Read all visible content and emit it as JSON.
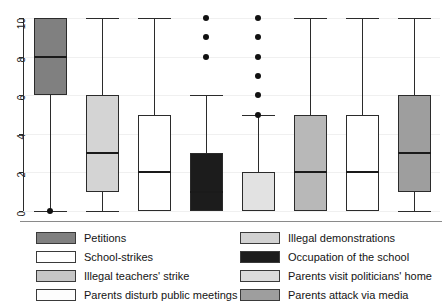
{
  "chart_data": {
    "type": "box",
    "title": "",
    "xlabel": "",
    "ylabel": "",
    "ylim": [
      0,
      10
    ],
    "yticks": [
      0,
      2,
      4,
      6,
      8,
      10
    ],
    "ytick_labels": [
      "0",
      "2",
      "4",
      "6",
      "8",
      "10"
    ],
    "grid": true,
    "legend_position": "bottom",
    "categories": [
      "Petitions",
      "School-strikes",
      "Illegal teachers' strike",
      "Parents disturb public meetings",
      "Illegal demonstrations",
      "Occupation of the school",
      "Parents visit politicians' home",
      "Parents attack via media",
      "Parents attack via media"
    ],
    "boxes": [
      {
        "name": "Petitions",
        "fill": "#808080",
        "whisker_low": 0,
        "q1": 6,
        "median": 8,
        "q3": 10,
        "whisker_high": 10,
        "outliers": [
          0
        ]
      },
      {
        "name": "School-strikes",
        "fill": "#d4d4d4",
        "whisker_low": 0,
        "q1": 1,
        "median": 3,
        "q3": 6,
        "whisker_high": 10,
        "outliers": []
      },
      {
        "name": "Illegal teachers' strike",
        "fill": "#ffffff",
        "whisker_low": 0,
        "q1": 0,
        "median": 2,
        "q3": 5,
        "whisker_high": 10,
        "outliers": []
      },
      {
        "name": "Parents disturb public meetings",
        "fill": "#1c1c1c",
        "whisker_low": 0,
        "q1": 0,
        "median": 1,
        "q3": 3,
        "whisker_high": 6,
        "outliers": [
          8,
          9,
          10
        ]
      },
      {
        "name": "Illegal demonstrations",
        "fill": "#e2e2e2",
        "whisker_low": 0,
        "q1": 0,
        "median": 0,
        "q3": 2,
        "whisker_high": 5,
        "outliers": [
          5,
          6,
          7,
          8,
          9,
          10
        ]
      },
      {
        "name": "Occupation of the school",
        "fill": "#b8b8b8",
        "whisker_low": 0,
        "q1": 0,
        "median": 2,
        "q3": 5,
        "whisker_high": 10,
        "outliers": []
      },
      {
        "name": "Parents visit politicians' home",
        "fill": "#ffffff",
        "whisker_low": 0,
        "q1": 0,
        "median": 2,
        "q3": 5,
        "whisker_high": 10,
        "outliers": []
      },
      {
        "name": "Parents attack via media",
        "fill": "#9e9e9e",
        "whisker_low": 0,
        "q1": 1,
        "median": 3,
        "q3": 6,
        "whisker_high": 10,
        "outliers": []
      }
    ]
  },
  "legend": {
    "left_column": [
      {
        "label": "Petitions",
        "color": "#808080"
      },
      {
        "label": "School-strikes",
        "color": "#ffffff"
      },
      {
        "label": "Illegal teachers' strike",
        "color": "#c6c6c6"
      },
      {
        "label": "Parents disturb public meetings",
        "color": "#fdfdfd"
      }
    ],
    "right_column": [
      {
        "label": "Illegal demonstrations",
        "color": "#d2d2d2"
      },
      {
        "label": "Occupation of the school",
        "color": "#1c1c1c"
      },
      {
        "label": "Parents visit politicians' home",
        "color": "#dcdcdc"
      },
      {
        "label": "Parents attack via media",
        "color": "#9e9e9e"
      }
    ]
  }
}
